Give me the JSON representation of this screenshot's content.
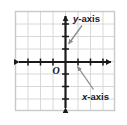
{
  "diagram": {
    "origin_label": "O",
    "y_axis_label": "y-axis",
    "y_axis_label_var": "y",
    "y_axis_label_rest": "-axis",
    "x_axis_label": "x-axis",
    "x_axis_label_var": "x",
    "x_axis_label_rest": "-axis",
    "colors": {
      "background": "#ffffff",
      "grid_line": "#d8d8d8",
      "frame_border": "#c9c9c9",
      "axis": "#1a1a1a",
      "label_text": "#1a1a1a",
      "leader_arrow": "#8a8a8a"
    },
    "grid": {
      "columns": 8,
      "rows": 8,
      "cell_size": 12.5,
      "frame_left": 15,
      "frame_top": 11,
      "frame_right": 115,
      "frame_bottom": 111
    },
    "axes": {
      "x_axis": {
        "y_position": 62,
        "start_x": 14,
        "end_x": 116,
        "tick_count": 8,
        "arrowheads": [
          "left",
          "right"
        ]
      },
      "y_axis": {
        "x_position": 65,
        "start_y": 11,
        "end_y": 113,
        "tick_count": 8,
        "arrowheads": [
          "up",
          "down"
        ]
      }
    },
    "callouts": [
      {
        "name": "y-axis-callout",
        "label": "y-axis",
        "text_x": 74,
        "text_y": 21,
        "arrow_from_x": 82,
        "arrow_from_y": 25,
        "arrow_to_x": 67,
        "arrow_to_y": 45
      },
      {
        "name": "x-axis-callout",
        "label": "x-axis",
        "text_x": 83,
        "text_y": 99,
        "arrow_from_x": 94,
        "arrow_from_y": 90,
        "arrow_to_x": 76,
        "arrow_to_y": 66
      }
    ]
  }
}
